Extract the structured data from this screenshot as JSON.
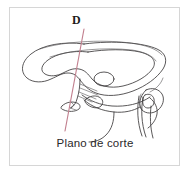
{
  "figure": {
    "title": "Plano de corte",
    "plane_label": "D",
    "caption": "Plano de corte",
    "colors": {
      "plane_line": "#c2808f",
      "outline": "#3c3a3b",
      "outline_light": "#565456",
      "frame_border": "#d6d6d6",
      "background": "#ffffff",
      "label_text": "#1d1b1c",
      "caption_text": "#2a2829"
    },
    "annotations": [
      {
        "name": "plane-label",
        "text": "D"
      },
      {
        "name": "caption",
        "text": "Plano de corte"
      }
    ]
  }
}
